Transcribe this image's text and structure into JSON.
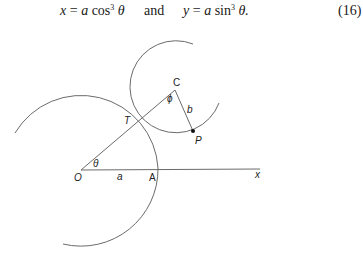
{
  "equation": {
    "x_lhs": "x",
    "x_rhs_coef": "a",
    "x_fn": "cos",
    "x_power": "3",
    "x_arg": "θ",
    "connector": "and",
    "y_lhs": "y",
    "y_rhs_coef": "a",
    "y_fn": "sin",
    "y_power": "3",
    "y_arg": "θ.",
    "number": "(16)"
  },
  "diagram": {
    "labels": {
      "C": "C",
      "phi": "ϕ",
      "b": "b",
      "P": "P",
      "T": "T",
      "O": "O",
      "theta": "θ",
      "a": "a",
      "A": "A",
      "x_axis": "x"
    },
    "colors": {
      "stroke": "#6b6b6b",
      "text": "#222222"
    }
  }
}
